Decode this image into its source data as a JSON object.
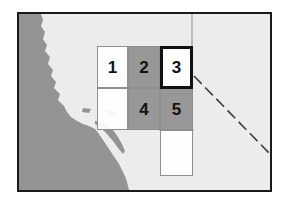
{
  "figure": {
    "type": "reference-map-with-numbered-grid",
    "background_color": "#ffffff",
    "frame": {
      "border_color": "#1a1a1a",
      "border_width_px": 2,
      "x": 17,
      "y": 12,
      "width": 255,
      "height": 180
    }
  },
  "map": {
    "land_color": "#ededed",
    "ocean_color": "#9a9a9a",
    "boundary_line_color": "#6e6e6e",
    "dashed_border_color": "#4a4a4a",
    "features": [
      {
        "name": "ocean",
        "label": "Pacific Ocean",
        "shade": "#9a9a9a"
      },
      {
        "name": "land",
        "label": "Land",
        "shade": "#ededed"
      },
      {
        "name": "state-line-vertical",
        "label": "State boundary",
        "shade": "#6e6e6e"
      },
      {
        "name": "international-border-dashed",
        "label": "Dashed border",
        "shade": "#4a4a4a"
      }
    ]
  },
  "grid": {
    "columns": 3,
    "rows": 3,
    "origin_x": 78,
    "origin_y": 32,
    "cell_width": 31,
    "cell_height": 42,
    "selected_cell_label": "3",
    "cell_border_color": "#8f8f8f",
    "selected_border_color": "#111111",
    "cells": [
      {
        "label": "1",
        "row": 0,
        "col": 0,
        "shade": "light",
        "selected": false,
        "has_label": true
      },
      {
        "label": "2",
        "row": 0,
        "col": 1,
        "shade": "dark",
        "selected": false,
        "has_label": true
      },
      {
        "label": "3",
        "row": 0,
        "col": 2,
        "shade": "light",
        "selected": true,
        "has_label": true
      },
      {
        "label": "",
        "row": 1,
        "col": 0,
        "shade": "light",
        "selected": false,
        "has_label": false
      },
      {
        "label": "4",
        "row": 1,
        "col": 1,
        "shade": "dark",
        "selected": false,
        "has_label": true
      },
      {
        "label": "5",
        "row": 1,
        "col": 2,
        "shade": "dark",
        "selected": false,
        "has_label": true
      },
      {
        "label": "",
        "row": 2,
        "col": 2,
        "shade": "light",
        "selected": false,
        "has_label": false
      }
    ]
  }
}
